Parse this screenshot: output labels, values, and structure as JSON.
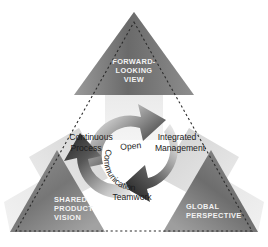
{
  "diagram": {
    "background_color": "#ffffff",
    "outline": {
      "name": "dotted-triangle-outline",
      "style": "dashed",
      "color": "#2b2b2b"
    },
    "outer_arrows": [
      {
        "id": "forward-looking-view",
        "direction": "up",
        "lines": [
          "FORWARD-",
          "LOOKING",
          "VIEW"
        ],
        "label_color": "#f2f2f2",
        "fill_dark": "#6f6f6f",
        "fill_light": "#d8d8d8"
      },
      {
        "id": "shared-product-vision",
        "direction": "down-left",
        "lines": [
          "SHARED",
          "PRODUCT",
          "VISION"
        ],
        "label_color": "#f2f2f2",
        "fill_dark": "#7a7a7a",
        "fill_light": "#dcdcdc"
      },
      {
        "id": "global-perspective",
        "direction": "down-right",
        "lines": [
          "GLOBAL",
          "PERSPECTIVE"
        ],
        "label_color": "#f2f2f2",
        "fill_dark": "#6b6b6b",
        "fill_light": "#d5d5d5"
      }
    ],
    "center_cycle": {
      "id": "open-communication-cycle",
      "center_text_lines": [
        "Open",
        "Communication"
      ],
      "center_text_color": "#1c1c1c",
      "arrows": [
        {
          "id": "continuous-process-arc",
          "label_lines": [
            "Continuous",
            "Process"
          ],
          "fill_dark": "#4a4a4a",
          "fill_light": "#e6e6e6"
        },
        {
          "id": "integrated-management-arc",
          "label_lines": [
            "Integrated",
            "Management"
          ],
          "fill_dark": "#3f3f3f",
          "fill_light": "#e2e2e2"
        },
        {
          "id": "teamwork-arc",
          "label_lines": [
            "Teamwork"
          ],
          "fill_dark": "#3a3a3a",
          "fill_light": "#e0e0e0"
        }
      ]
    }
  }
}
